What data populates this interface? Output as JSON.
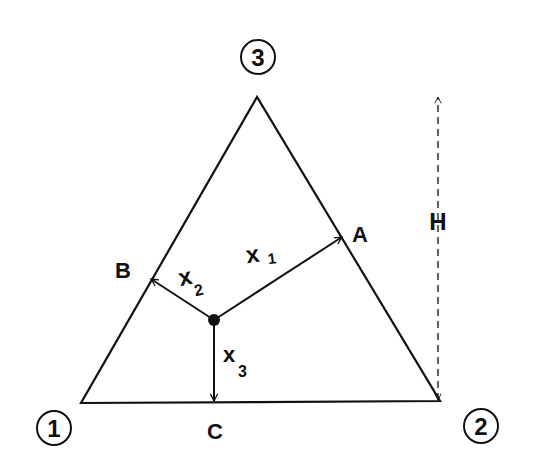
{
  "diagram": {
    "type": "ternary-composition-triangle",
    "vertices": [
      {
        "id": "1",
        "label": "1"
      },
      {
        "id": "2",
        "label": "2"
      },
      {
        "id": "3",
        "label": "3"
      }
    ],
    "edge_points": {
      "A": "A",
      "B": "B",
      "C": "C"
    },
    "distances": {
      "x1": {
        "base": "x",
        "sub": "1"
      },
      "x2": {
        "base": "x",
        "sub": "2"
      },
      "x3": {
        "base": "x",
        "sub": "3"
      }
    },
    "height_label": "H",
    "colors": {
      "ink": "#111111",
      "background": "#ffffff"
    }
  }
}
